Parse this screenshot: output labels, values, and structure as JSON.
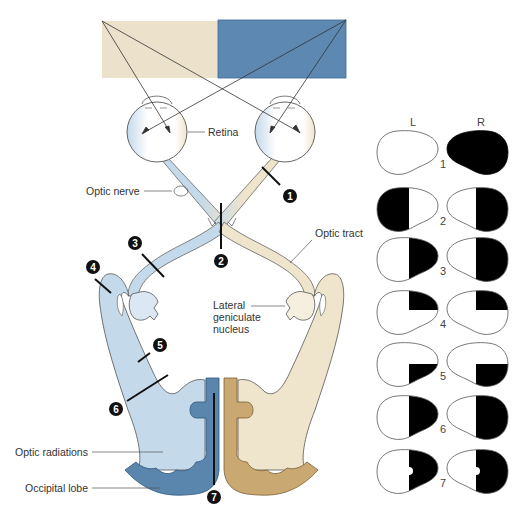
{
  "figure": {
    "colors": {
      "left_field": "#ece2cc",
      "right_field": "#5c88b2",
      "blue_pathway": "#c4d9ea",
      "blue_cortex": "#5a86ae",
      "beige_pathway": "#efe4cc",
      "beige_cortex": "#c9a872",
      "outline": "#555555",
      "defect": "#000000"
    }
  },
  "labels": {
    "retina": "Retina",
    "optic_nerve": "Optic nerve",
    "optic_tract": "Optic tract",
    "lgn_line1": "Lateral",
    "lgn_line2": "geniculate",
    "lgn_line3": "nucleus",
    "optic_radiations": "Optic radiations",
    "occipital_lobe": "Occipital lobe"
  },
  "lesion_markers": [
    {
      "number": "1",
      "site": "Optic nerve (right)"
    },
    {
      "number": "2",
      "site": "Optic chiasm"
    },
    {
      "number": "3",
      "site": "Optic tract (left)"
    },
    {
      "number": "4",
      "site": "Meyer's loop (left)"
    },
    {
      "number": "5",
      "site": "Parietal optic radiation (left)"
    },
    {
      "number": "6",
      "site": "Optic radiation (left)"
    },
    {
      "number": "7",
      "site": "Occipital cortex (left)"
    }
  ],
  "visual_fields": {
    "column_left": "L",
    "column_right": "R",
    "rows": [
      {
        "number": "1",
        "left_defect": "none",
        "right_defect": "full"
      },
      {
        "number": "2",
        "left_defect": "temporal half",
        "right_defect": "temporal half"
      },
      {
        "number": "3",
        "left_defect": "right half",
        "right_defect": "right half"
      },
      {
        "number": "4",
        "left_defect": "upper right quadrant",
        "right_defect": "upper right quadrant"
      },
      {
        "number": "5",
        "left_defect": "lower right quadrant",
        "right_defect": "lower right quadrant"
      },
      {
        "number": "6",
        "left_defect": "right half",
        "right_defect": "right half"
      },
      {
        "number": "7",
        "left_defect": "right half, macular sparing",
        "right_defect": "right half, macular sparing"
      }
    ]
  }
}
